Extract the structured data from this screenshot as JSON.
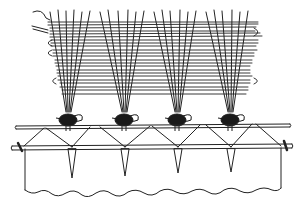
{
  "figure": {
    "ink_color": "#222222",
    "background": "#ffffff",
    "knot_count": 4,
    "warp_groups": 4,
    "rods": 2
  }
}
